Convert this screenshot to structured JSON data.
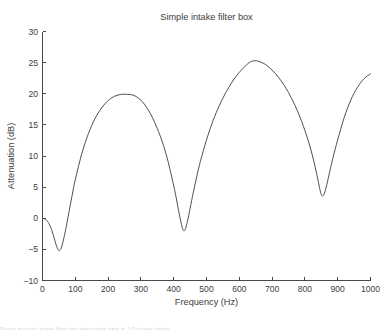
{
  "figure": {
    "caption_clipped": "Figure  acoustic  intake  filter  box  attenuation  data  at  1/3  octave  bands"
  },
  "chart_data": {
    "type": "line",
    "title": "Simple intake filter box",
    "xlabel": "Frequency (Hz)",
    "ylabel": "Attenuation (dB)",
    "xlim": [
      0,
      1000
    ],
    "ylim": [
      -10,
      30
    ],
    "xticks": [
      0,
      100,
      200,
      300,
      400,
      500,
      600,
      700,
      800,
      900,
      1000
    ],
    "yticks": [
      -10,
      -5,
      0,
      5,
      10,
      15,
      20,
      25,
      30
    ],
    "grid": false,
    "legend": null,
    "series": [
      {
        "name": "Attenuation",
        "color": "#4f4f4f",
        "x": [
          0,
          10,
          20,
          30,
          40,
          45,
          50,
          55,
          60,
          70,
          80,
          90,
          100,
          120,
          140,
          160,
          180,
          200,
          220,
          240,
          260,
          275,
          290,
          305,
          320,
          335,
          350,
          365,
          380,
          395,
          405,
          415,
          422,
          428,
          432,
          436,
          442,
          450,
          460,
          475,
          490,
          510,
          530,
          550,
          570,
          590,
          610,
          630,
          645,
          660,
          680,
          700,
          720,
          740,
          760,
          780,
          800,
          815,
          828,
          838,
          845,
          850,
          855,
          862,
          872,
          885,
          900,
          920,
          940,
          960,
          980,
          1000
        ],
        "y": [
          0.0,
          -0.2,
          -0.9,
          -2.2,
          -4.0,
          -4.8,
          -5.2,
          -5.0,
          -4.3,
          -2.0,
          0.8,
          3.6,
          6.2,
          10.4,
          13.6,
          16.0,
          17.7,
          18.9,
          19.6,
          19.9,
          19.9,
          19.8,
          19.4,
          18.7,
          17.6,
          16.2,
          14.4,
          12.3,
          9.7,
          6.4,
          4.0,
          1.2,
          -0.6,
          -1.8,
          -2.0,
          -1.7,
          -0.5,
          1.6,
          4.2,
          7.8,
          10.8,
          14.2,
          17.0,
          19.3,
          21.2,
          22.8,
          24.0,
          25.0,
          25.3,
          25.2,
          24.7,
          23.8,
          22.6,
          21.1,
          19.2,
          16.9,
          14.1,
          11.6,
          9.0,
          6.6,
          4.8,
          3.8,
          3.6,
          4.4,
          6.6,
          9.6,
          12.6,
          16.2,
          19.0,
          21.0,
          22.4,
          23.2
        ]
      }
    ]
  }
}
